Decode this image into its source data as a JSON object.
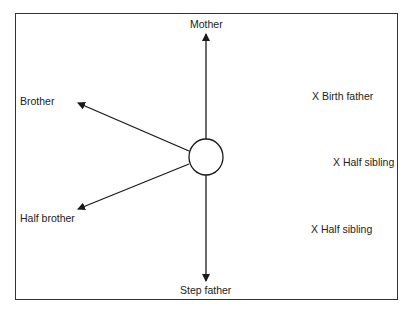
{
  "diagram": {
    "center": {
      "x": 206,
      "y": 157,
      "r": 17
    },
    "line_color": "#1a1a1a",
    "connected": [
      {
        "label": "Mother",
        "direction": "up"
      },
      {
        "label": "Brother",
        "direction": "upper-left"
      },
      {
        "label": "Half brother",
        "direction": "lower-left"
      },
      {
        "label": "Step father",
        "direction": "down"
      }
    ],
    "not_connected": [
      {
        "label": "X Birth father"
      },
      {
        "label": "X Half sibling"
      },
      {
        "label": "X Half sibling"
      }
    ]
  }
}
